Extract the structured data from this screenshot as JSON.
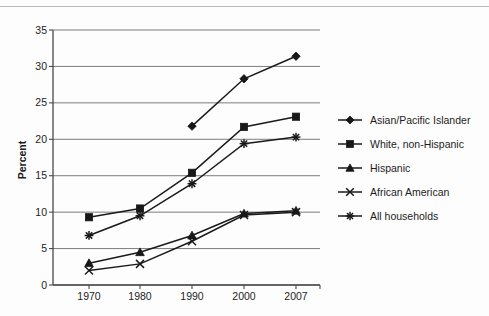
{
  "chart_data": {
    "type": "line",
    "title": "",
    "xlabel": "",
    "ylabel": "Percent",
    "categories": [
      "1970",
      "1980",
      "1990",
      "2000",
      "2007"
    ],
    "ylim": [
      0,
      35
    ],
    "yticks": [
      "0",
      "5",
      "10",
      "15",
      "20",
      "25",
      "30",
      "35"
    ],
    "grid": true,
    "legend_position": "right",
    "series": [
      {
        "name": "Asian/Pacific Islander",
        "marker": "diamond",
        "x": [
          "1990",
          "2000",
          "2007"
        ],
        "values": [
          21.8,
          28.3,
          31.4
        ]
      },
      {
        "name": "White, non-Hispanic",
        "marker": "square",
        "x": [
          "1970",
          "1980",
          "1990",
          "2000",
          "2007"
        ],
        "values": [
          9.3,
          10.5,
          15.4,
          21.7,
          23.1
        ]
      },
      {
        "name": "Hispanic",
        "marker": "triangle",
        "x": [
          "1970",
          "1980",
          "1990",
          "2000",
          "2007"
        ],
        "values": [
          3.0,
          4.5,
          6.8,
          9.8,
          10.2
        ]
      },
      {
        "name": "African American",
        "marker": "x",
        "x": [
          "1970",
          "1980",
          "1990",
          "2000",
          "2007"
        ],
        "values": [
          2.0,
          2.9,
          6.0,
          9.6,
          10.0
        ]
      },
      {
        "name": "All households",
        "marker": "asterisk",
        "x": [
          "1970",
          "1980",
          "1990",
          "2000",
          "2007"
        ],
        "values": [
          6.8,
          9.5,
          13.9,
          19.4,
          20.3
        ]
      }
    ]
  },
  "axis": {
    "y_title": "Percent",
    "y_tick_0": "0",
    "y_tick_1": "5",
    "y_tick_2": "10",
    "y_tick_3": "15",
    "y_tick_4": "20",
    "y_tick_5": "25",
    "y_tick_6": "30",
    "y_tick_7": "35",
    "x_tick_0": "1970",
    "x_tick_1": "1980",
    "x_tick_2": "1990",
    "x_tick_3": "2000",
    "x_tick_4": "2007"
  },
  "legend": {
    "item_0": "Asian/Pacific Islander",
    "item_1": "White, non-Hispanic",
    "item_2": "Hispanic",
    "item_3": "African American",
    "item_4": "All households"
  },
  "colors": {
    "ink": "#181818",
    "grid": "#6e6e6e",
    "axis": "#4a4a4a",
    "background": "#fdfdfd"
  }
}
